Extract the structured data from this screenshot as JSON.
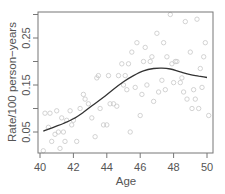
{
  "chart_data": {
    "type": "scatter",
    "title": "",
    "xlabel": "Age",
    "ylabel": "Rate/100 person−years",
    "xlim": [
      39.9,
      50.3
    ],
    "ylim": [
      0.0,
      0.3
    ],
    "x_ticks": [
      40,
      42,
      44,
      46,
      48,
      50
    ],
    "x_tick_labels": [
      "40",
      "42",
      "44",
      "46",
      "48",
      "50"
    ],
    "y_ticks": [
      0.05,
      0.1,
      0.15,
      0.2,
      0.25,
      0.3
    ],
    "y_tick_labels": [
      "0.05",
      "",
      "0.15",
      "",
      "0.25",
      ""
    ],
    "grid": false,
    "legend": null,
    "series": [
      {
        "name": "observed rates",
        "kind": "scatter",
        "marker": "open-circle",
        "color": "#c8c8c8",
        "points": [
          [
            40.2,
            0.01
          ],
          [
            40.3,
            0.09
          ],
          [
            40.5,
            0.06
          ],
          [
            40.6,
            0.09
          ],
          [
            40.7,
            0.03
          ],
          [
            40.9,
            0.045
          ],
          [
            41.0,
            0.095
          ],
          [
            41.1,
            0.05
          ],
          [
            41.2,
            0.015
          ],
          [
            41.3,
            0.08
          ],
          [
            41.4,
            0.05
          ],
          [
            41.5,
            0.03
          ],
          [
            41.6,
            0.075
          ],
          [
            41.8,
            0.095
          ],
          [
            41.9,
            0.065
          ],
          [
            42.0,
            0.075
          ],
          [
            42.2,
            0.03
          ],
          [
            42.4,
            0.1
          ],
          [
            42.6,
            0.13
          ],
          [
            42.7,
            0.12
          ],
          [
            42.9,
            0.11
          ],
          [
            43.1,
            0.08
          ],
          [
            43.3,
            0.04
          ],
          [
            43.4,
            0.165
          ],
          [
            43.5,
            0.17
          ],
          [
            43.6,
            0.1
          ],
          [
            43.8,
            0.065
          ],
          [
            44.0,
            0.065
          ],
          [
            44.1,
            0.17
          ],
          [
            44.2,
            0.11
          ],
          [
            44.4,
            0.11
          ],
          [
            44.6,
            0.105
          ],
          [
            44.7,
            0.17
          ],
          [
            44.9,
            0.195
          ],
          [
            45.0,
            0.15
          ],
          [
            45.1,
            0.17
          ],
          [
            45.2,
            0.14
          ],
          [
            45.3,
            0.195
          ],
          [
            45.4,
            0.05
          ],
          [
            45.5,
            0.22
          ],
          [
            45.7,
            0.145
          ],
          [
            45.8,
            0.24
          ],
          [
            46.0,
            0.085
          ],
          [
            46.1,
            0.13
          ],
          [
            46.2,
            0.2
          ],
          [
            46.3,
            0.23
          ],
          [
            46.4,
            0.15
          ],
          [
            46.6,
            0.2
          ],
          [
            46.7,
            0.21
          ],
          [
            46.8,
            0.115
          ],
          [
            47.0,
            0.26
          ],
          [
            47.1,
            0.135
          ],
          [
            47.3,
            0.16
          ],
          [
            47.4,
            0.24
          ],
          [
            47.5,
            0.14
          ],
          [
            47.6,
            0.21
          ],
          [
            47.8,
            0.3
          ],
          [
            47.9,
            0.195
          ],
          [
            48.0,
            0.155
          ],
          [
            48.1,
            0.2
          ],
          [
            48.2,
            0.2
          ],
          [
            48.4,
            0.155
          ],
          [
            48.5,
            0.165
          ],
          [
            48.6,
            0.135
          ],
          [
            48.7,
            0.285
          ],
          [
            48.8,
            0.12
          ],
          [
            49.0,
            0.22
          ],
          [
            49.1,
            0.1
          ],
          [
            49.2,
            0.14
          ],
          [
            49.3,
            0.12
          ],
          [
            49.4,
            0.29
          ],
          [
            49.5,
            0.1
          ],
          [
            49.6,
            0.185
          ],
          [
            49.7,
            0.145
          ],
          [
            49.8,
            0.21
          ],
          [
            49.9,
            0.24
          ],
          [
            50.1,
            0.085
          ]
        ]
      },
      {
        "name": "smoothed fit",
        "kind": "line",
        "color": "#333333",
        "x": [
          40.2,
          40.8,
          41.4,
          42.0,
          42.6,
          43.2,
          43.8,
          44.4,
          45.0,
          45.6,
          46.2,
          46.8,
          47.3,
          47.8,
          48.4,
          49.0,
          49.5,
          50.0
        ],
        "y": [
          0.052,
          0.06,
          0.068,
          0.078,
          0.092,
          0.108,
          0.124,
          0.141,
          0.157,
          0.17,
          0.18,
          0.185,
          0.186,
          0.184,
          0.178,
          0.172,
          0.169,
          0.166
        ]
      }
    ]
  }
}
